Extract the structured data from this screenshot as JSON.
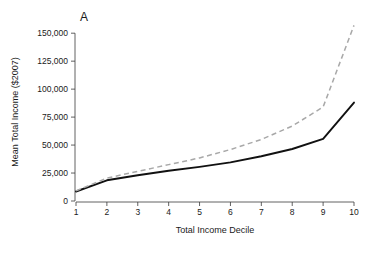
{
  "chart_data": {
    "type": "line",
    "title": "",
    "panel_label": "A",
    "xlabel": "Total Income Decile",
    "ylabel": "Mean Total Income ($2007)",
    "categories": [
      1,
      2,
      3,
      4,
      5,
      6,
      7,
      8,
      9,
      10
    ],
    "x_tick_labels": [
      "1",
      "2",
      "3",
      "4",
      "5",
      "6",
      "7",
      "8",
      "9",
      "10"
    ],
    "y_tick_labels": [
      "0",
      "25,000",
      "50,000",
      "75,000",
      "100,000",
      "125,000",
      "150,000"
    ],
    "y_tick_values": [
      0,
      25000,
      50000,
      75000,
      100000,
      125000,
      150000
    ],
    "xlim": [
      1,
      10
    ],
    "ylim": [
      0,
      160000
    ],
    "grid": false,
    "legend": "none",
    "series": [
      {
        "name": "solid-series",
        "style": "solid",
        "color": "#111111",
        "values": [
          8500,
          18500,
          23000,
          27000,
          30500,
          34500,
          40000,
          46500,
          55500,
          88000
        ]
      },
      {
        "name": "dashed-series",
        "style": "dashed",
        "color": "#a8a8a8",
        "values": [
          9000,
          20500,
          26500,
          32500,
          38500,
          46000,
          55000,
          67000,
          84000,
          157000
        ]
      }
    ]
  },
  "geometry": {
    "plot_left": 76,
    "plot_right": 354,
    "plot_bottom": 201,
    "plot_top": 22,
    "y_axis_x": 75,
    "x_axis_y": 202,
    "tick_len": 4,
    "panel_label_x": 80,
    "panel_label_y": 21,
    "xlabel_x": 215,
    "xlabel_y": 233,
    "ylabel_x": 18,
    "ylabel_y": 112
  }
}
